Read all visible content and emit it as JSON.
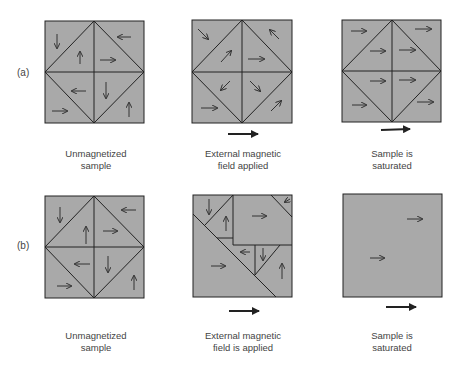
{
  "colors": {
    "domain_fill": "#a9a9a9",
    "line": "#222222",
    "arrow": "#333333",
    "text": "#444444"
  },
  "rows": [
    {
      "label": "(a)",
      "panels": [
        {
          "caption": [
            "Unmagnetized",
            "sample"
          ],
          "field_arrow": false
        },
        {
          "caption": [
            "External magnetic",
            "field applied"
          ],
          "field_arrow": true
        },
        {
          "caption": [
            "Sample is",
            "saturated"
          ],
          "field_arrow": true
        }
      ]
    },
    {
      "label": "(b)",
      "panels": [
        {
          "caption": [
            "Unmagnetized",
            "sample"
          ],
          "field_arrow": false
        },
        {
          "caption": [
            "External magnetic",
            "field is applied"
          ],
          "field_arrow": true
        },
        {
          "caption": [
            "Sample is",
            "saturated"
          ],
          "field_arrow": true
        }
      ]
    }
  ]
}
